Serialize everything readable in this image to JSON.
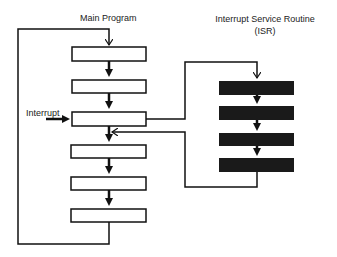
{
  "diagram": {
    "main_program": {
      "title": "Main Program",
      "box_count": 6
    },
    "isr": {
      "title_line1": "Interrupt Service Routine",
      "title_line2": "(ISR)",
      "box_count": 4
    },
    "interrupt_label": "Interrupt",
    "colors": {
      "line": "#111111",
      "main_box_fill": "#ffffff",
      "isr_box_fill": "#1a1a1a",
      "background": "#ffffff"
    }
  }
}
